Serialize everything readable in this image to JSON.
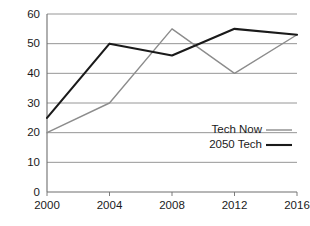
{
  "chart_data": {
    "type": "line",
    "title": "",
    "xlabel": "",
    "ylabel": "",
    "categories": [
      "2000",
      "2004",
      "2008",
      "2012",
      "2016"
    ],
    "x": [
      2000,
      2004,
      2008,
      2012,
      2016
    ],
    "xlim": [
      2000,
      2016
    ],
    "ylim": [
      0,
      60
    ],
    "yticks": [
      0,
      10,
      20,
      30,
      40,
      50,
      60
    ],
    "ytick_labels": [
      "0",
      "10",
      "20",
      "30",
      "40",
      "50",
      "60"
    ],
    "xtick_labels": [
      "2000",
      "2004",
      "2008",
      "2012",
      "2016"
    ],
    "grid": "horizontal",
    "legend_position": "inside-right",
    "series": [
      {
        "name": "Tech Now",
        "color": "#8c8c8c",
        "line_width": 1.4,
        "values": [
          20,
          30,
          55,
          40,
          53
        ]
      },
      {
        "name": "2050 Tech",
        "color": "#1a1a1a",
        "line_width": 2.1,
        "values": [
          25,
          50,
          46,
          55,
          53
        ]
      }
    ]
  },
  "axes": {
    "axis_color": "#6e6e6e",
    "grid_color": "#8a8a8a",
    "background": "#ffffff"
  },
  "legend": {
    "entries": [
      {
        "label": "Tech Now",
        "swatch": "legend-line-tech-now"
      },
      {
        "label": "2050 Tech",
        "swatch": "legend-line-2050-tech"
      }
    ]
  }
}
